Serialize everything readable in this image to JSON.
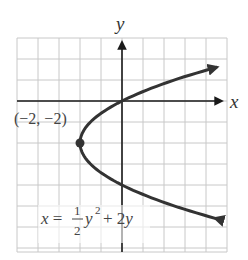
{
  "chart_data": {
    "type": "line",
    "title": "",
    "equation": "x = (1/2)y^2 + 2y",
    "equation_label": {
      "lhs": "x =",
      "frac_num": "1",
      "frac_den": "2",
      "term1": "y",
      "exp": "2",
      "rest": "+ 2y"
    },
    "xlabel": "x",
    "ylabel": "y",
    "xlim": [
      -5,
      5
    ],
    "ylim": [
      -7,
      3
    ],
    "grid": true,
    "grid_step": 1,
    "points": [
      {
        "x": 5.0,
        "y": -5.74
      },
      {
        "x": 2.5,
        "y": -5
      },
      {
        "x": 0,
        "y": -4
      },
      {
        "x": -1.5,
        "y": -3
      },
      {
        "x": -2,
        "y": -2
      },
      {
        "x": -1.5,
        "y": -1
      },
      {
        "x": 0,
        "y": 0
      },
      {
        "x": 2.5,
        "y": 1
      },
      {
        "x": 5.0,
        "y": 1.74
      }
    ],
    "annotations": [
      {
        "text": "(−2, −2)",
        "x": -2,
        "y": -2,
        "marker": "dot",
        "note": "vertex"
      }
    ],
    "arrows": "both ends of curve, x-axis positive end, y-axis positive end"
  },
  "colors": {
    "curve": "#333333",
    "grid": "#c8c8c8",
    "axis": "#1a1a1a"
  }
}
